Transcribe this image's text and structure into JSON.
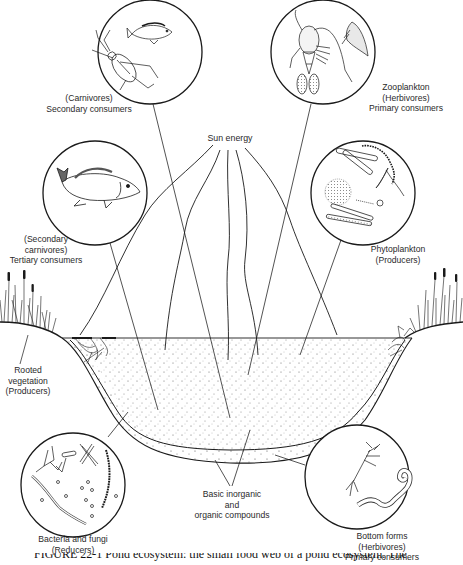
{
  "diagram": {
    "type": "pond-ecosystem-food-web",
    "labels": {
      "carnivores": [
        "(Carnivores)",
        "Secondary consumers"
      ],
      "zooplankton": [
        "Zooplankton",
        "(Herbivores)",
        "Primary consumers"
      ],
      "sun_energy": [
        "Sun energy"
      ],
      "secondary_carnivores": [
        "(Secondary",
        "carnivores)",
        "Tertiary consumers"
      ],
      "phytoplankton": [
        "Phytoplankton",
        "(Producers)"
      ],
      "rooted_vegetation": [
        "Rooted",
        "vegetation",
        "(Producers)"
      ],
      "bacteria_fungi": [
        "Bacteria and fungi",
        "(Reducers)"
      ],
      "basic_compounds": [
        "Basic inorganic",
        "and",
        "organic compounds"
      ],
      "bottom_forms": [
        "Bottom forms",
        "(Herbivores)",
        "Primary consumers"
      ]
    },
    "circles": [
      {
        "id": "carnivores",
        "depicts": [
          "water beetle",
          "small fish"
        ]
      },
      {
        "id": "zooplankton",
        "depicts": [
          "copepod",
          "water flea"
        ]
      },
      {
        "id": "secondary_carnivores",
        "depicts": [
          "large fish"
        ]
      },
      {
        "id": "phytoplankton",
        "depicts": [
          "diatoms",
          "filamentous algae",
          "colonial alga"
        ]
      },
      {
        "id": "bacteria_fungi",
        "depicts": [
          "fungal hyphae",
          "bacilli",
          "cocci",
          "chain bacteria"
        ]
      },
      {
        "id": "bottom_forms",
        "depicts": [
          "insect larva",
          "worm"
        ]
      }
    ],
    "caption_partial": "FIGURE 22-1 Pond ecosystem: the small food web of a pond ecosystem. The"
  },
  "colors": {
    "ink": "#1a1a1a",
    "paper": "#ffffff",
    "stipple": "#555555"
  }
}
